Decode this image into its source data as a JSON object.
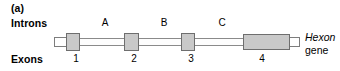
{
  "figure": {
    "panel_letter": "(a)",
    "row_labels": {
      "introns": "Introns",
      "exons": "Exons"
    },
    "gene_name": {
      "italic_part": "Hexon",
      "plain_part": "gene"
    },
    "introns": [
      {
        "label": "A"
      },
      {
        "label": "B"
      },
      {
        "label": "C"
      }
    ],
    "exons": [
      {
        "number": "1"
      },
      {
        "number": "2"
      },
      {
        "number": "3"
      },
      {
        "number": "4"
      }
    ],
    "colors": {
      "exon_fill": "#c9c9c9",
      "exon_stroke": "#6e6e6e",
      "intron_fill": "#fdfdfd",
      "intron_stroke": "#8a8a8a",
      "background": "#ffffff",
      "text": "#000000"
    }
  }
}
